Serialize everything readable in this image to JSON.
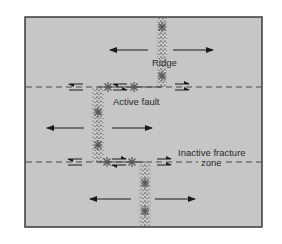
{
  "figure": {
    "type": "plate-tectonics-transform-fault-diagram",
    "background_color": "#c6c6c6",
    "frame_color": "#3a3a3a",
    "labels": {
      "ridge": "Ridge",
      "active_fault": "Active fault",
      "inactive_fracture_zone_line1": "Inactive fracture",
      "inactive_fracture_zone_line2": "zone"
    },
    "ridge_segments": [
      {
        "name": "upper-ridge",
        "x": 162,
        "y_start": 17,
        "y_end": 87,
        "earthquakes_y": [
          27,
          76
        ]
      },
      {
        "name": "middle-ridge",
        "x": 98,
        "y_start": 87,
        "y_end": 162,
        "earthquakes_y": [
          112,
          145
        ]
      },
      {
        "name": "lower-ridge",
        "x": 145,
        "y_start": 162,
        "y_end": 227,
        "earthquakes_y": [
          183,
          211
        ]
      }
    ],
    "fracture_lines_y": [
      87,
      162
    ],
    "spreading_arrows": [
      {
        "y": 50,
        "left": [
          148,
          110
        ],
        "right": [
          173,
          213
        ]
      },
      {
        "y": 128,
        "left": [
          84,
          47
        ],
        "right": [
          112,
          152
        ]
      },
      {
        "y": 199,
        "left": [
          131,
          90
        ],
        "right": [
          155,
          195
        ]
      }
    ],
    "fault_earthquakes": [
      {
        "x": 108,
        "y": 87
      },
      {
        "x": 134,
        "y": 87
      },
      {
        "x": 107,
        "y": 162
      },
      {
        "x": 132,
        "y": 162
      }
    ]
  }
}
